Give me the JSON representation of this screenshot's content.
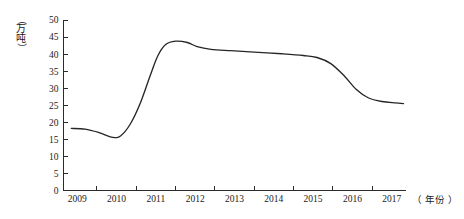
{
  "chart_data": {
    "type": "line",
    "title": "",
    "xlabel": "（年份）",
    "ylabel": "（万吨）",
    "grid": false,
    "legend": "none",
    "xlim": [
      2008.65,
      2017.35
    ],
    "ylim": [
      0,
      50
    ],
    "y_ticks": [
      0,
      5,
      10,
      15,
      20,
      25,
      30,
      35,
      40,
      45,
      50
    ],
    "x_ticks": [
      "2009",
      "2010",
      "2011",
      "2012",
      "2013",
      "2014",
      "2015",
      "2016",
      "2017"
    ],
    "categories": [
      2009,
      2010,
      2011,
      2012,
      2013,
      2014,
      2015,
      2016,
      2017
    ],
    "values": [
      18.2,
      16.0,
      43.5,
      41.5,
      40.5,
      40.0,
      39.0,
      26.5,
      25.5
    ],
    "series": [
      {
        "name": "产量",
        "points": [
          [
            2008.85,
            18.2
          ],
          [
            2009.2,
            18.0
          ],
          [
            2009.55,
            17.0
          ],
          [
            2009.9,
            15.6
          ],
          [
            2010.1,
            16.0
          ],
          [
            2010.35,
            19.5
          ],
          [
            2010.6,
            25.5
          ],
          [
            2010.85,
            33.5
          ],
          [
            2011.05,
            39.5
          ],
          [
            2011.25,
            42.8
          ],
          [
            2011.5,
            43.8
          ],
          [
            2011.8,
            43.4
          ],
          [
            2012.05,
            42.2
          ],
          [
            2012.4,
            41.4
          ],
          [
            2012.9,
            41.0
          ],
          [
            2013.5,
            40.6
          ],
          [
            2014.2,
            40.1
          ],
          [
            2014.75,
            39.6
          ],
          [
            2015.1,
            39.0
          ],
          [
            2015.45,
            37.2
          ],
          [
            2015.8,
            33.5
          ],
          [
            2016.1,
            29.6
          ],
          [
            2016.4,
            27.2
          ],
          [
            2016.75,
            26.1
          ],
          [
            2017.1,
            25.7
          ],
          [
            2017.3,
            25.5
          ]
        ]
      }
    ]
  },
  "axis": {
    "unit_y_chars": [
      "（",
      "万",
      "吨",
      "）"
    ],
    "unit_x": "（ 年份 ）"
  }
}
